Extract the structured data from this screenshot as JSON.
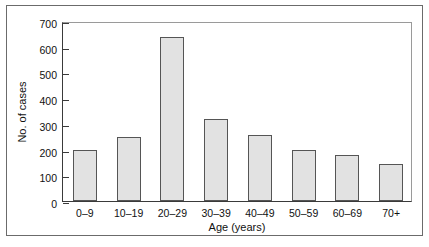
{
  "chart_data": {
    "type": "bar",
    "title": "",
    "subtitle": "",
    "xlabel": "Age (years)",
    "ylabel": "No. of cases",
    "categories": [
      "0–9",
      "10–19",
      "20–29",
      "30–39",
      "40–49",
      "50–59",
      "60–69",
      "70+"
    ],
    "values": [
      200,
      250,
      636,
      320,
      258,
      200,
      178,
      145
    ],
    "ylim": [
      0,
      700
    ],
    "yticks": [
      0,
      100,
      200,
      300,
      400,
      500,
      600,
      700
    ],
    "ytick_labels": [
      "0",
      "100",
      "200",
      "300",
      "400",
      "500",
      "600",
      "700"
    ],
    "grid": false,
    "legend": null,
    "series": [
      {
        "name": "No. of cases",
        "values": [
          200,
          250,
          636,
          320,
          258,
          200,
          178,
          145
        ]
      }
    ],
    "colors": {
      "bar_fill": "#e2e2e2",
      "bar_stroke": "#555555",
      "axis": "#3a3a3a",
      "frame": "#6b6b6b",
      "text": "#111111",
      "background": "#ffffff"
    }
  }
}
